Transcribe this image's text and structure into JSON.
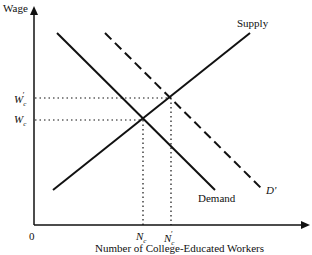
{
  "diagram": {
    "type": "supply-demand",
    "y_axis_label": "Wage",
    "x_axis_label": "Number of College-Educated Workers",
    "origin_label": "0",
    "curves": [
      {
        "name": "Supply",
        "style": "solid",
        "from": [
          53,
          190
        ],
        "to": [
          250,
          33
        ]
      },
      {
        "name": "Demand",
        "style": "solid",
        "from": [
          57,
          33
        ],
        "to": [
          215,
          190
        ]
      },
      {
        "name": "D'",
        "style": "dashed",
        "from": [
          105,
          33
        ],
        "to": [
          263,
          190
        ]
      }
    ],
    "y_ticks": [
      {
        "label": "W",
        "sub": "c",
        "prime": true,
        "y": 98
      },
      {
        "label": "W",
        "sub": "c",
        "prime": false,
        "y": 120
      }
    ],
    "x_ticks": [
      {
        "label": "N",
        "sub": "c",
        "prime": false,
        "x": 143
      },
      {
        "label": "N",
        "sub": "c",
        "prime": true,
        "x": 171
      }
    ]
  },
  "labels": {
    "wage": "Wage",
    "supply": "Supply",
    "demand": "Demand",
    "d_prime": "D'",
    "origin": "0",
    "xlabel": "Number of College-Educated Workers",
    "wc_prime": "W",
    "wc": "W",
    "nc": "N",
    "nc_prime": "N",
    "sub_c": "c",
    "prime": "′"
  }
}
